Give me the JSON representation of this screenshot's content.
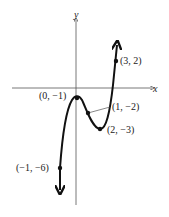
{
  "axes": {
    "x_label": "x",
    "y_label": "y"
  },
  "points": [
    {
      "label": "(3, 2)",
      "x": 3,
      "y": 2
    },
    {
      "label": "(0, −1)",
      "x": 0,
      "y": -1
    },
    {
      "label": "(1, −2)",
      "x": 1,
      "y": -2
    },
    {
      "label": "(2, −3)",
      "x": 2,
      "y": -3
    },
    {
      "label": "(−1, −6)",
      "x": -1,
      "y": -6
    }
  ],
  "colors": {
    "curve": "#111111",
    "axis": "#555555"
  }
}
